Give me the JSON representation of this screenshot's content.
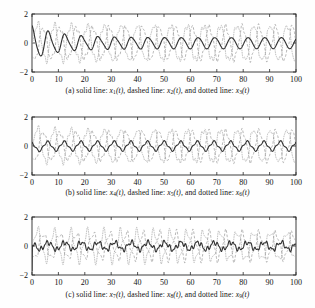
{
  "figure": {
    "background_color": "#fefefe",
    "panel_count": 3
  },
  "chart_data": [
    {
      "type": "line",
      "panel_id": "a",
      "title": "",
      "xlabel": "",
      "ylabel": "",
      "xlim": [
        0,
        100
      ],
      "ylim": [
        -2,
        2
      ],
      "xticks": [
        0,
        10,
        20,
        30,
        40,
        50,
        60,
        70,
        80,
        90,
        100
      ],
      "yticks": [
        -2,
        0,
        2
      ],
      "grid": false,
      "legend_position": "caption-below",
      "series": [
        {
          "name": "x1(t)",
          "style": "solid",
          "color": "#333333",
          "description": "damped oscillation starting near 1.35 at t=0, settling to steady oscillation of amplitude about 0.45 around 0 with period about 6.3",
          "initial_value": 1.35,
          "steady_amplitude": 0.45,
          "period": 6.3
        },
        {
          "name": "x2(t)",
          "style": "dashed",
          "color": "#9a9a9a",
          "description": "oscillation of amplitude about 1.1 around 0 with period about 6.3",
          "initial_value": -0.2,
          "steady_amplitude": 1.1,
          "period": 6.3
        },
        {
          "name": "x3(t)",
          "style": "dotted",
          "color": "#aaaaaa",
          "description": "oscillation of amplitude about 1.25 around 0 with period about 6.3, phase shifted",
          "initial_value": 0.3,
          "steady_amplitude": 1.25,
          "period": 6.3
        }
      ]
    },
    {
      "type": "line",
      "panel_id": "b",
      "title": "",
      "xlabel": "",
      "ylabel": "",
      "xlim": [
        0,
        100
      ],
      "ylim": [
        -2,
        2
      ],
      "xticks": [
        0,
        10,
        20,
        30,
        40,
        50,
        60,
        70,
        80,
        90,
        100
      ],
      "yticks": [
        -2,
        0,
        2
      ],
      "grid": false,
      "legend_position": "caption-below",
      "series": [
        {
          "name": "x4(t)",
          "style": "solid",
          "color": "#333333",
          "description": "small-amplitude ripple about 0.3 around 0 with period about 6.3",
          "initial_value": 0.2,
          "steady_amplitude": 0.3,
          "period": 6.3
        },
        {
          "name": "x5(t)",
          "style": "dashed",
          "color": "#9a9a9a",
          "description": "oscillation of amplitude about 1.0 around 0 with period about 6.3",
          "initial_value": -0.1,
          "steady_amplitude": 1.0,
          "period": 6.3
        },
        {
          "name": "x6(t)",
          "style": "dotted",
          "color": "#aaaaaa",
          "description": "oscillation of amplitude about 1.15 around 0 with period about 6.3, phase shifted",
          "initial_value": 0.4,
          "steady_amplitude": 1.15,
          "period": 6.3
        }
      ]
    },
    {
      "type": "line",
      "panel_id": "c",
      "title": "",
      "xlabel": "",
      "ylabel": "",
      "xlim": [
        0,
        100
      ],
      "ylim": [
        -2,
        2
      ],
      "xticks": [
        0,
        10,
        20,
        30,
        40,
        50,
        60,
        70,
        80,
        90,
        100
      ],
      "yticks": [
        -2,
        0,
        2
      ],
      "grid": false,
      "legend_position": "caption-below",
      "series": [
        {
          "name": "x7(t)",
          "style": "solid",
          "color": "#333333",
          "description": "sharp initial spike down to -2 at t=0 then small high-frequency ripple of amplitude about 0.25 around 0",
          "initial_value": -2.0,
          "steady_amplitude": 0.25,
          "period": 6.3
        },
        {
          "name": "x8(t)",
          "style": "dashed",
          "color": "#9a9a9a",
          "description": "higher-frequency oscillation of amplitude about 0.85 around 0",
          "initial_value": 0.0,
          "steady_amplitude": 0.85,
          "period": 6.3
        },
        {
          "name": "x9(t)",
          "style": "dotted",
          "color": "#aaaaaa",
          "description": "higher-frequency oscillation of amplitude about 0.95 around 0, phase shifted",
          "initial_value": 0.5,
          "steady_amplitude": 0.95,
          "period": 6.3
        }
      ]
    }
  ],
  "panels": [
    {
      "id": "a",
      "axis": {
        "xticks": [
          "0",
          "10",
          "20",
          "30",
          "40",
          "50",
          "60",
          "70",
          "80",
          "90",
          "100"
        ],
        "yticks": [
          "2",
          "0",
          "−2"
        ]
      },
      "caption": {
        "label": "(a)",
        "text_1": "solid line:",
        "var_1": "x",
        "sub_1": "1",
        "arg_1": "(t),",
        "text_2": "dashed line:",
        "var_2": "x",
        "sub_2": "2",
        "arg_2": "(t),",
        "text_3": "and dotted line:",
        "var_3": "x",
        "sub_3": "3",
        "arg_3": "(t)",
        "full": "(a) solid line: x1(t), dashed line: x2(t), and dotted line: x3(t)"
      }
    },
    {
      "id": "b",
      "axis": {
        "xticks": [
          "0",
          "10",
          "20",
          "30",
          "40",
          "50",
          "60",
          "70",
          "80",
          "90",
          "100"
        ],
        "yticks": [
          "2",
          "0",
          "−2"
        ]
      },
      "caption": {
        "label": "(b)",
        "text_1": "solid line:",
        "var_1": "x",
        "sub_1": "4",
        "arg_1": "(t),",
        "text_2": "dashed line:",
        "var_2": "x",
        "sub_2": "5",
        "arg_2": "(t),",
        "text_3": "and dotted line:",
        "var_3": "x",
        "sub_3": "6",
        "arg_3": "(t)",
        "full": "(b) solid line: x4(t), dashed line: x5(t), and dotted line: x6(t)"
      }
    },
    {
      "id": "c",
      "axis": {
        "xticks": [
          "0",
          "10",
          "20",
          "30",
          "40",
          "50",
          "60",
          "70",
          "80",
          "90",
          "100"
        ],
        "yticks": [
          "2",
          "0",
          "−2"
        ]
      },
      "caption": {
        "label": "(c)",
        "text_1": "solid line:",
        "var_1": "x",
        "sub_1": "7",
        "arg_1": "(t),",
        "text_2": "dashed line:",
        "var_2": "x",
        "sub_2": "8",
        "arg_2": "(t),",
        "text_3": "and dotted line:",
        "var_3": "x",
        "sub_3": "9",
        "arg_3": "(t)",
        "full": "(c) solid line: x7(t), dashed line: x8(t), and dotted line: x9(t)"
      }
    }
  ]
}
